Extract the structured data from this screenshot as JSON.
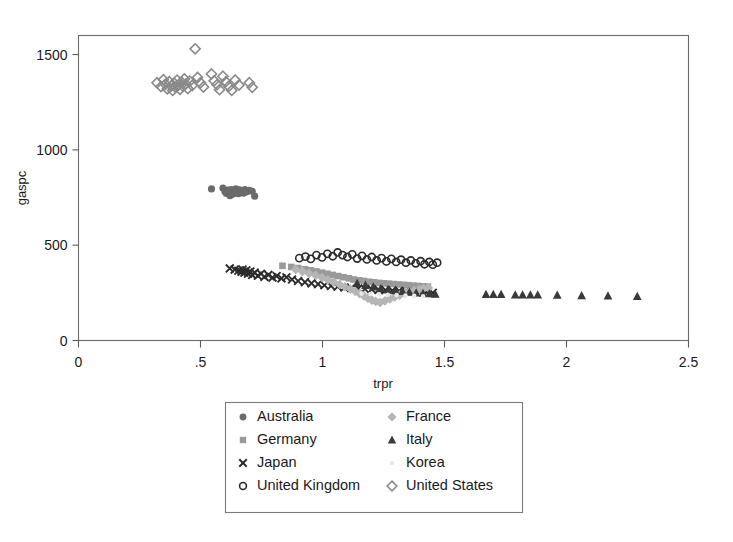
{
  "chart_data": {
    "type": "scatter",
    "title": "",
    "xlabel": "trpr",
    "ylabel": "gaspc",
    "xlim": [
      0,
      2.5
    ],
    "ylim": [
      0,
      1600
    ],
    "xticks": [
      0,
      0.5,
      1,
      1.5,
      2,
      2.5
    ],
    "xticklabels": [
      "0",
      ".5",
      "1",
      "1.5",
      "2",
      "2.5"
    ],
    "yticks": [
      0,
      500,
      1000,
      1500
    ],
    "yticklabels": [
      "0",
      "500",
      "1000",
      "1500"
    ],
    "grid": false,
    "legend_position": "below-center",
    "legend_columns": 2,
    "series": [
      {
        "name": "Australia",
        "marker": "filled-circle",
        "color": "#6b6b6b",
        "points": [
          [
            0.545,
            795
          ],
          [
            0.592,
            800
          ],
          [
            0.6,
            782
          ],
          [
            0.606,
            771
          ],
          [
            0.612,
            789
          ],
          [
            0.617,
            776
          ],
          [
            0.621,
            760
          ],
          [
            0.625,
            792
          ],
          [
            0.629,
            780
          ],
          [
            0.633,
            768
          ],
          [
            0.637,
            786
          ],
          [
            0.641,
            774
          ],
          [
            0.645,
            796
          ],
          [
            0.65,
            783
          ],
          [
            0.655,
            770
          ],
          [
            0.66,
            790
          ],
          [
            0.665,
            778
          ],
          [
            0.67,
            785
          ],
          [
            0.676,
            773
          ],
          [
            0.682,
            792
          ],
          [
            0.69,
            780
          ],
          [
            0.7,
            788
          ],
          [
            0.712,
            783
          ],
          [
            0.722,
            757
          ]
        ]
      },
      {
        "name": "Germany",
        "marker": "filled-square",
        "color": "#9a9a9a",
        "points": [
          [
            0.836,
            392
          ],
          [
            0.872,
            386
          ],
          [
            0.9,
            380
          ],
          [
            0.928,
            374
          ],
          [
            0.952,
            368
          ],
          [
            0.975,
            362
          ],
          [
            0.998,
            356
          ],
          [
            1.02,
            350
          ],
          [
            1.042,
            344
          ],
          [
            1.064,
            338
          ],
          [
            1.086,
            332
          ],
          [
            1.108,
            326
          ],
          [
            1.128,
            320
          ],
          [
            1.15,
            316
          ],
          [
            1.17,
            312
          ],
          [
            1.192,
            308
          ],
          [
            1.212,
            305
          ],
          [
            1.232,
            302
          ],
          [
            1.252,
            300
          ],
          [
            1.272,
            298
          ],
          [
            1.292,
            296
          ],
          [
            1.312,
            294
          ],
          [
            1.332,
            292
          ],
          [
            1.352,
            290
          ],
          [
            1.372,
            288
          ],
          [
            1.392,
            286
          ],
          [
            1.412,
            284
          ],
          [
            1.432,
            282
          ]
        ]
      },
      {
        "name": "Japan",
        "marker": "cross",
        "color": "#2b2b2b",
        "points": [
          [
            0.62,
            378
          ],
          [
            0.64,
            372
          ],
          [
            0.655,
            366
          ],
          [
            0.668,
            360
          ],
          [
            0.672,
            372
          ],
          [
            0.68,
            356
          ],
          [
            0.688,
            368
          ],
          [
            0.695,
            350
          ],
          [
            0.704,
            362
          ],
          [
            0.712,
            344
          ],
          [
            0.722,
            356
          ],
          [
            0.735,
            340
          ],
          [
            0.748,
            350
          ],
          [
            0.762,
            334
          ],
          [
            0.778,
            344
          ],
          [
            0.795,
            330
          ],
          [
            0.812,
            338
          ],
          [
            0.832,
            326
          ],
          [
            0.852,
            332
          ],
          [
            0.875,
            320
          ],
          [
            0.9,
            312
          ],
          [
            0.928,
            306
          ],
          [
            0.955,
            300
          ],
          [
            0.982,
            296
          ],
          [
            1.008,
            290
          ],
          [
            1.035,
            286
          ],
          [
            1.062,
            282
          ],
          [
            1.09,
            278
          ],
          [
            1.118,
            275
          ],
          [
            1.146,
            272
          ],
          [
            1.174,
            270
          ],
          [
            1.202,
            268
          ],
          [
            1.23,
            266
          ],
          [
            1.258,
            264
          ],
          [
            1.286,
            262
          ],
          [
            1.314,
            260
          ],
          [
            1.342,
            258
          ],
          [
            1.37,
            256
          ],
          [
            1.398,
            254
          ],
          [
            1.426,
            252
          ],
          [
            1.452,
            250
          ]
        ]
      },
      {
        "name": "United Kingdom",
        "marker": "open-circle",
        "color": "#2b2b2b",
        "points": [
          [
            0.905,
            432
          ],
          [
            0.93,
            440
          ],
          [
            0.952,
            428
          ],
          [
            0.975,
            448
          ],
          [
            0.998,
            436
          ],
          [
            1.02,
            455
          ],
          [
            1.042,
            442
          ],
          [
            1.062,
            462
          ],
          [
            1.082,
            448
          ],
          [
            1.102,
            438
          ],
          [
            1.122,
            452
          ],
          [
            1.142,
            430
          ],
          [
            1.162,
            444
          ],
          [
            1.182,
            425
          ],
          [
            1.202,
            438
          ],
          [
            1.222,
            420
          ],
          [
            1.242,
            432
          ],
          [
            1.262,
            415
          ],
          [
            1.282,
            428
          ],
          [
            1.302,
            412
          ],
          [
            1.322,
            424
          ],
          [
            1.342,
            408
          ],
          [
            1.362,
            420
          ],
          [
            1.382,
            405
          ],
          [
            1.402,
            416
          ],
          [
            1.418,
            400
          ],
          [
            1.438,
            412
          ],
          [
            1.452,
            398
          ],
          [
            1.47,
            408
          ]
        ]
      },
      {
        "name": "France",
        "marker": "filled-diamond",
        "color": "#b5b5b5",
        "points": [
          [
            0.89,
            372
          ],
          [
            0.918,
            362
          ],
          [
            0.945,
            352
          ],
          [
            0.972,
            342
          ],
          [
            0.998,
            330
          ],
          [
            1.022,
            318
          ],
          [
            1.046,
            306
          ],
          [
            1.07,
            294
          ],
          [
            1.092,
            282
          ],
          [
            1.114,
            270
          ],
          [
            1.134,
            258
          ],
          [
            1.152,
            246
          ],
          [
            1.17,
            234
          ],
          [
            1.186,
            222
          ],
          [
            1.202,
            212
          ],
          [
            1.218,
            205
          ],
          [
            1.236,
            200
          ],
          [
            1.256,
            208
          ],
          [
            1.276,
            218
          ],
          [
            1.296,
            228
          ],
          [
            1.316,
            238
          ],
          [
            1.336,
            248
          ],
          [
            1.356,
            256
          ],
          [
            1.376,
            262
          ],
          [
            1.396,
            268
          ],
          [
            1.414,
            272
          ],
          [
            1.434,
            276
          ]
        ]
      },
      {
        "name": "Italy",
        "marker": "filled-triangle",
        "color": "#3a3a3a",
        "points": [
          [
            1.142,
            300
          ],
          [
            1.176,
            290
          ],
          [
            1.208,
            282
          ],
          [
            1.238,
            272
          ],
          [
            1.268,
            266
          ],
          [
            1.298,
            262
          ],
          [
            1.328,
            258
          ],
          [
            1.356,
            254
          ],
          [
            1.384,
            250
          ],
          [
            1.412,
            248
          ],
          [
            1.438,
            246
          ],
          [
            1.462,
            244
          ],
          [
            1.67,
            242
          ],
          [
            1.7,
            242
          ],
          [
            1.732,
            242
          ],
          [
            1.79,
            240
          ],
          [
            1.82,
            240
          ],
          [
            1.852,
            240
          ],
          [
            1.882,
            240
          ],
          [
            1.962,
            238
          ],
          [
            2.062,
            236
          ],
          [
            2.17,
            234
          ],
          [
            2.29,
            232
          ]
        ]
      },
      {
        "name": "Korea",
        "marker": "dot-faint",
        "color": "#e8e8e8",
        "points": [
          [
            1.16,
            246
          ],
          [
            1.196,
            244
          ],
          [
            1.232,
            242
          ],
          [
            1.268,
            240
          ],
          [
            1.304,
            238
          ],
          [
            1.34,
            236
          ],
          [
            1.376,
            234
          ],
          [
            1.412,
            232
          ]
        ]
      },
      {
        "name": "United States",
        "marker": "open-diamond",
        "color": "#8a8a8a",
        "points": [
          [
            0.322,
            1352
          ],
          [
            0.338,
            1332
          ],
          [
            0.348,
            1368
          ],
          [
            0.356,
            1344
          ],
          [
            0.364,
            1320
          ],
          [
            0.372,
            1358
          ],
          [
            0.38,
            1336
          ],
          [
            0.386,
            1312
          ],
          [
            0.392,
            1350
          ],
          [
            0.398,
            1328
          ],
          [
            0.404,
            1366
          ],
          [
            0.41,
            1340
          ],
          [
            0.416,
            1318
          ],
          [
            0.422,
            1356
          ],
          [
            0.428,
            1334
          ],
          [
            0.434,
            1372
          ],
          [
            0.44,
            1346
          ],
          [
            0.448,
            1322
          ],
          [
            0.456,
            1360
          ],
          [
            0.466,
            1338
          ],
          [
            0.478,
            1530
          ],
          [
            0.488,
            1380
          ],
          [
            0.5,
            1352
          ],
          [
            0.512,
            1330
          ],
          [
            0.545,
            1398
          ],
          [
            0.556,
            1362
          ],
          [
            0.568,
            1342
          ],
          [
            0.578,
            1316
          ],
          [
            0.592,
            1386
          ],
          [
            0.604,
            1358
          ],
          [
            0.616,
            1334
          ],
          [
            0.628,
            1312
          ],
          [
            0.642,
            1366
          ],
          [
            0.658,
            1340
          ],
          [
            0.7,
            1352
          ],
          [
            0.712,
            1328
          ]
        ]
      }
    ]
  },
  "legend": {
    "entries": [
      {
        "label": "Australia",
        "marker": "filled-circle",
        "color": "#6b6b6b"
      },
      {
        "label": "France",
        "marker": "filled-diamond",
        "color": "#b5b5b5"
      },
      {
        "label": "Germany",
        "marker": "filled-square",
        "color": "#9a9a9a"
      },
      {
        "label": "Italy",
        "marker": "filled-triangle",
        "color": "#3a3a3a"
      },
      {
        "label": "Japan",
        "marker": "cross",
        "color": "#2b2b2b"
      },
      {
        "label": "Korea",
        "marker": "dot-faint",
        "color": "#e8e8e8"
      },
      {
        "label": "United Kingdom",
        "marker": "open-circle",
        "color": "#2b2b2b"
      },
      {
        "label": "United States",
        "marker": "open-diamond",
        "color": "#8a8a8a"
      }
    ]
  }
}
